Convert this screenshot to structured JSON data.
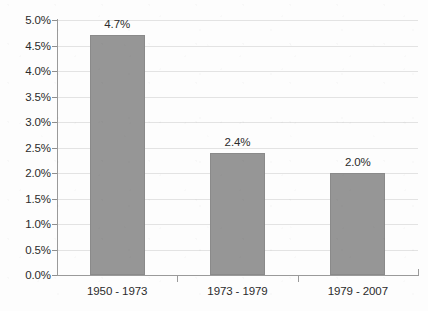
{
  "chart_data": {
    "type": "bar",
    "title": "",
    "subtitle": "",
    "xlabel": "",
    "ylabel": "",
    "categories": [
      "1950 - 1973",
      "1973 - 1979",
      "1979 - 2007"
    ],
    "values": [
      4.7,
      2.4,
      2.0
    ],
    "value_labels": [
      "4.7%",
      "2.4%",
      "2.0%"
    ],
    "ylim": [
      0.0,
      5.0
    ],
    "ytick_step": 0.5,
    "ytick_labels": [
      "0.0%",
      "0.5%",
      "1.0%",
      "1.5%",
      "2.0%",
      "2.5%",
      "3.0%",
      "3.5%",
      "4.0%",
      "4.5%",
      "5.0%"
    ],
    "ytick_values": [
      0.0,
      0.5,
      1.0,
      1.5,
      2.0,
      2.5,
      3.0,
      3.5,
      4.0,
      4.5,
      5.0
    ],
    "grid": true,
    "grid_axis": "y",
    "legend": false,
    "legend_position": "none",
    "units": "percent",
    "series": [
      {
        "name": "",
        "values": [
          4.7,
          2.4,
          2.0
        ]
      }
    ]
  },
  "style": {
    "bar_color": "#969696",
    "bar_border_color": "#8a8a8a",
    "gridline_color": "#e3e3e3",
    "axis_color": "#9a9a9a",
    "text_color": "#2b2b2b",
    "background_color": "#fdfdfd"
  }
}
